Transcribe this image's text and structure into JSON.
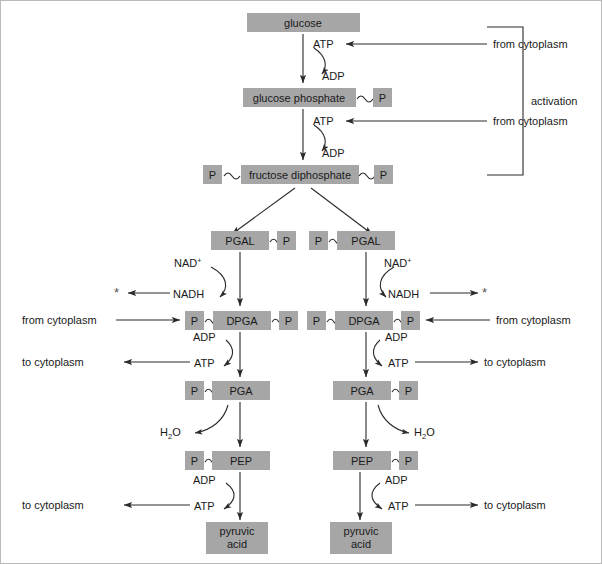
{
  "figure": {
    "type": "biochemical-pathway-flowchart",
    "colors": {
      "molecule_box_fill": "#a6a6a6",
      "arrow_stroke": "#2b2b2b",
      "text": "#1a1a1a",
      "background": "#ffffff"
    }
  },
  "labels": {
    "glucose": "glucose",
    "glucose_phosphate": "glucose phosphate",
    "fructose_diphosphate": "fructose diphosphate",
    "pgal": "PGAL",
    "dpga": "DPGA",
    "pga": "PGA",
    "pep": "PEP",
    "pyruvic_line1": "pyruvic",
    "pyruvic_line2": "acid",
    "phosphate": "P",
    "atp": "ATP",
    "adp": "ADP",
    "nad": "NAD",
    "nad_charge": "+",
    "nadh": "NADH",
    "water": "H",
    "water_sub": "2",
    "water_o": "O",
    "from_cytoplasm": "from cytoplasm",
    "to_cytoplasm": "to cytoplasm",
    "activation": "activation",
    "asterisk": "*"
  },
  "pathway": {
    "stages": [
      {
        "name": "glucose",
        "label": "glucose",
        "phosphates": 0
      },
      {
        "name": "glucose-phosphate",
        "label": "glucose phosphate",
        "phosphates": 1
      },
      {
        "name": "fructose-diphosphate",
        "label": "fructose diphosphate",
        "phosphates": 2
      },
      {
        "name": "pgal",
        "label": "PGAL",
        "phosphates": 1,
        "branches": 2
      },
      {
        "name": "dpga",
        "label": "DPGA",
        "phosphates": 2,
        "branches": 2
      },
      {
        "name": "pga",
        "label": "PGA",
        "phosphates": 1,
        "branches": 2
      },
      {
        "name": "pep",
        "label": "PEP",
        "phosphates": 1,
        "branches": 2
      },
      {
        "name": "pyruvic-acid",
        "label": "pyruvic acid",
        "phosphates": 0,
        "branches": 2
      }
    ],
    "cofactor_steps": [
      {
        "step": 1,
        "consumed": "ATP",
        "produced": "ADP",
        "source": "from cytoplasm"
      },
      {
        "step": 2,
        "consumed": "ATP",
        "produced": "ADP",
        "source": "from cytoplasm"
      },
      {
        "step": 3,
        "consumed": "NAD",
        "produced": "NADH",
        "destination": "*"
      },
      {
        "step": 4,
        "consumed": "ADP",
        "produced": "ATP",
        "destination": "to cytoplasm",
        "input": "from cytoplasm"
      },
      {
        "step": 5,
        "released": "H2O"
      },
      {
        "step": 6,
        "consumed": "ADP",
        "produced": "ATP",
        "destination": "to cytoplasm"
      }
    ],
    "bracket_label": "activation"
  }
}
